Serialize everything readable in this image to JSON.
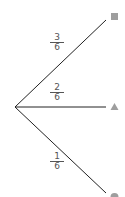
{
  "diagram": {
    "type": "probability-tree",
    "root": {
      "x": 15,
      "y": 107
    },
    "branches": [
      {
        "label_num": "3",
        "label_den": "6",
        "end": {
          "x": 106,
          "y": 20
        },
        "outcome_icon": "square-icon",
        "outcome_color": "#9e9e9e"
      },
      {
        "label_num": "2",
        "label_den": "6",
        "end": {
          "x": 106,
          "y": 107
        },
        "outcome_icon": "triangle-icon",
        "outcome_color": "#9e9e9e"
      },
      {
        "label_num": "1",
        "label_den": "6",
        "end": {
          "x": 106,
          "y": 194
        },
        "outcome_icon": "circle-icon",
        "outcome_color": "#9e9e9e"
      }
    ]
  }
}
